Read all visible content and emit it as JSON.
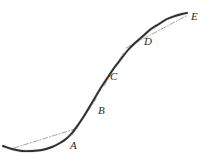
{
  "figure": {
    "background_color": "#ffffff",
    "curve_color": "#2e2e2e",
    "tangent_color": "#9a9a9a",
    "label_color": "#2b2b2b",
    "width": 210,
    "height": 167
  },
  "chart_data": {
    "type": "line",
    "title": "",
    "subtitle": "",
    "xlabel": "",
    "ylabel": "",
    "grid": false,
    "legend": "none",
    "axes_visible": false,
    "xlim": [
      0,
      210
    ],
    "ylim": [
      167,
      0
    ],
    "series": [
      {
        "name": "curve",
        "style": "solid",
        "color": "#2e2e2e",
        "points": [
          [
            3,
            146
          ],
          [
            12,
            149
          ],
          [
            22,
            151
          ],
          [
            32,
            151
          ],
          [
            42,
            150
          ],
          [
            52,
            147
          ],
          [
            60,
            143
          ],
          [
            66,
            139
          ],
          [
            72,
            133
          ],
          [
            78,
            125
          ],
          [
            84,
            116
          ],
          [
            90,
            106
          ],
          [
            96,
            96
          ],
          [
            102,
            86
          ],
          [
            108,
            77
          ],
          [
            114,
            68
          ],
          [
            121,
            59
          ],
          [
            128,
            50
          ],
          [
            135,
            43
          ],
          [
            143,
            36
          ],
          [
            151,
            29
          ],
          [
            159,
            24
          ],
          [
            167,
            19
          ],
          [
            175,
            16
          ],
          [
            182,
            14
          ],
          [
            187,
            13
          ]
        ]
      },
      {
        "name": "tangent-at-A",
        "style": "dash-dot",
        "color": "#9a9a9a",
        "points": [
          [
            14,
            148
          ],
          [
            78,
            128
          ]
        ]
      },
      {
        "name": "tangent-at-B",
        "style": "dash-dot",
        "color": "#9a9a9a",
        "points": [
          [
            72,
            135
          ],
          [
            96,
            99
          ]
        ]
      },
      {
        "name": "tangent-at-C",
        "style": "dash-dot",
        "color": "#9a9a9a",
        "points": [
          [
            104,
            86
          ],
          [
            124,
            52
          ]
        ]
      },
      {
        "name": "tangent-at-D",
        "style": "dash-dot",
        "color": "#9a9a9a",
        "points": [
          [
            126,
            48
          ],
          [
            186,
            16
          ]
        ]
      }
    ],
    "annotations": [
      {
        "label": "A",
        "x": 70,
        "y": 149,
        "point_on_curve_x": 68,
        "point_on_curve_y": 137
      },
      {
        "label": "B",
        "x": 98,
        "y": 114,
        "point_on_curve_x": 92,
        "point_on_curve_y": 103
      },
      {
        "label": "C",
        "x": 110,
        "y": 80,
        "point_on_curve_x": 104,
        "point_on_curve_y": 83
      },
      {
        "label": "D",
        "x": 144,
        "y": 45,
        "point_on_curve_x": 140,
        "point_on_curve_y": 39
      },
      {
        "label": "E",
        "x": 191,
        "y": 20,
        "point_on_curve_x": 187,
        "point_on_curve_y": 13
      }
    ]
  }
}
